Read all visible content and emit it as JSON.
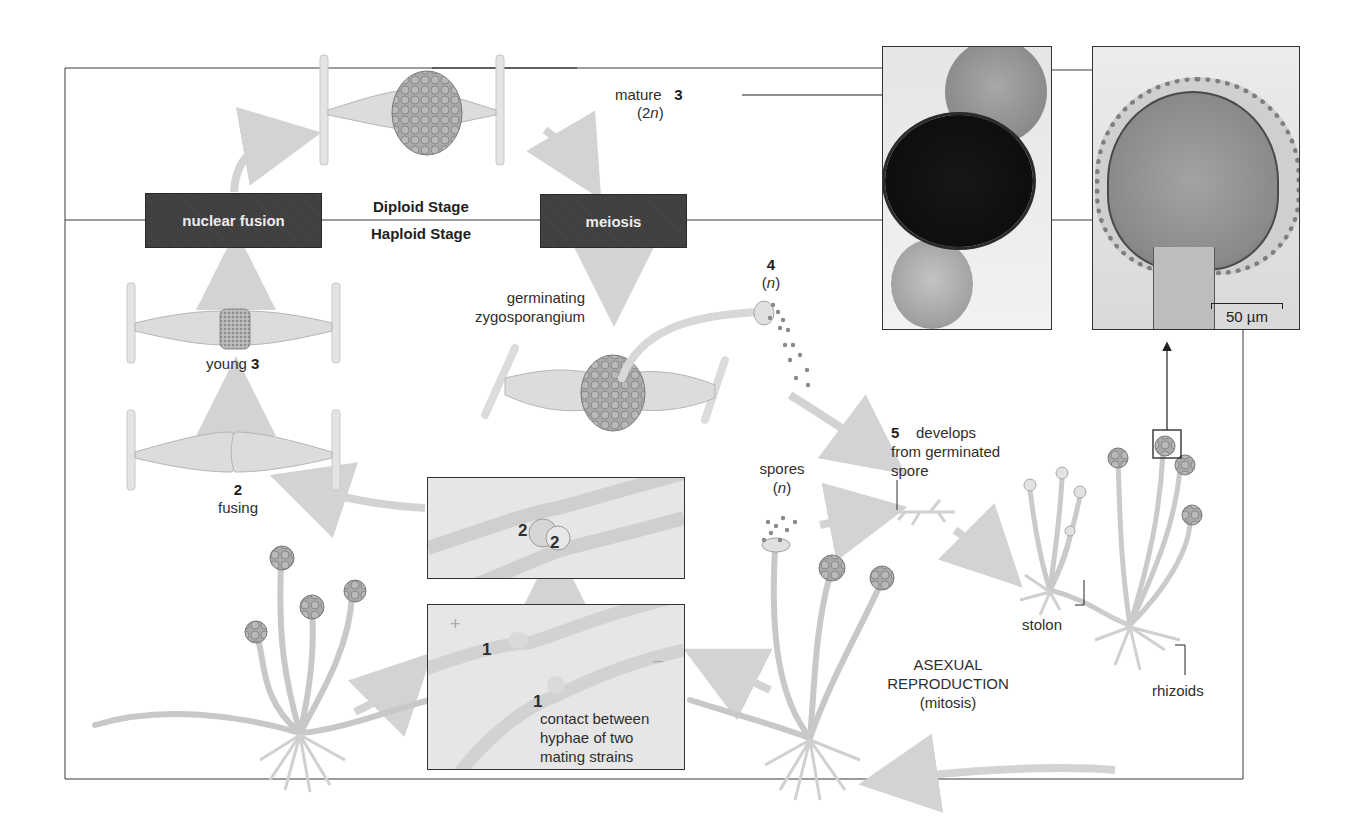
{
  "figure": {
    "stage_boxes": {
      "nuclear_fusion": "nuclear fusion",
      "meiosis": "meiosis"
    },
    "stage_divider": {
      "upper": "Diploid Stage",
      "lower": "Haploid Stage"
    },
    "labels": {
      "mature_word": "mature",
      "mature_num": "3",
      "mature_ploidy_pre": "(2",
      "mature_ploidy_n": "n",
      "mature_ploidy_post": ")",
      "young_word": "young",
      "young_num": "3",
      "fusing_num": "2",
      "fusing_word": "fusing",
      "germinating_line1": "germinating",
      "germinating_line2": "zygosporangium",
      "step4_num": "4",
      "step4_pre": "(",
      "step4_n": "n",
      "step4_post": ")",
      "step5_num": "5",
      "step5_line1": "develops",
      "step5_line2": "from germinated",
      "step5_line3": "spore",
      "spores_word": "spores",
      "spores_pre": "(",
      "spores_n": "n",
      "spores_post": ")",
      "inset_fusing_a": "2",
      "inset_fusing_b": "2",
      "inset_contact_a": "1",
      "inset_contact_b": "1",
      "inset_plus": "+",
      "inset_minus": "–",
      "contact_line1": "contact between",
      "contact_line2": "hyphae of two",
      "contact_line3": "mating strains",
      "asexual_line1": "ASEXUAL",
      "asexual_line2": "REPRODUCTION",
      "asexual_line3": "(mitosis)",
      "stolon": "stolon",
      "rhizoids": "rhizoids",
      "scale_bar": "50 µm"
    },
    "photos": [
      {
        "name": "zygosporangium-micrograph",
        "desc": "mature zygosporangium between two suspensors"
      },
      {
        "name": "sporangium-micrograph",
        "desc": "sporangium tip with spores"
      }
    ]
  }
}
